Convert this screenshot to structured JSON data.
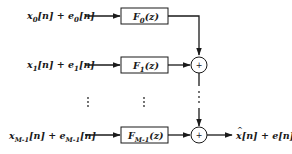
{
  "diagram": {
    "type": "signal-flow block diagram (synthesis filter bank)",
    "colors": {
      "stroke": "#1a1a1a",
      "background": "#ffffff"
    },
    "inputs": [
      {
        "id": "in0",
        "label_main": "x",
        "sub1": "0",
        "mid": "[n] + e",
        "sub2": "0",
        "tail": "[n]"
      },
      {
        "id": "in1",
        "label_main": "x",
        "sub1": "1",
        "mid": "[n] + e",
        "sub2": "1",
        "tail": "[n]"
      },
      {
        "id": "inM1",
        "label_main": "x",
        "sub1": "M-1",
        "mid": "[n] + e",
        "sub2": "M-1",
        "tail": "[n]"
      }
    ],
    "filters": [
      {
        "id": "F0",
        "main": "F",
        "sub": "0",
        "tail": "(z)"
      },
      {
        "id": "F1",
        "main": "F",
        "sub": "1",
        "tail": "(z)"
      },
      {
        "id": "FM1",
        "main": "F",
        "sub": "M-1",
        "tail": "(z)"
      }
    ],
    "adders": [
      {
        "id": "add1",
        "symbol": "+"
      },
      {
        "id": "add2",
        "symbol": "+"
      }
    ],
    "ellipsis": "⋮",
    "output": {
      "main": "x",
      "hat": "^",
      "mid": "[n] + e[n]"
    }
  }
}
